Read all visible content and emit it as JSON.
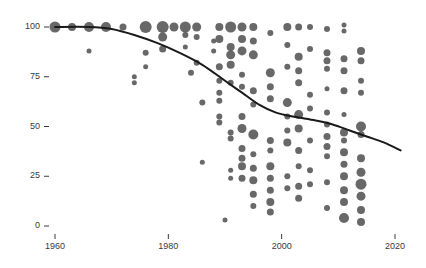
{
  "chart_data": {
    "type": "scatter",
    "title": "",
    "subtitle": "",
    "xlabel": "",
    "ylabel": "",
    "xlim": [
      1957,
      2024
    ],
    "ylim": [
      -4,
      105
    ],
    "grid": false,
    "legend": null,
    "marker_color": "#4d4d4d",
    "marker_opacity": 0.85,
    "line_color": "#1a1a1a",
    "line_width": 2.0,
    "size_encoding": "bubble area proportional to weight",
    "xticks": [
      1960,
      1980,
      2000,
      2020
    ],
    "xtick_labels": [
      "1960",
      "1980",
      "2000",
      "2020"
    ],
    "yticks": [
      0,
      25,
      50,
      75,
      100
    ],
    "ytick_labels": [
      "0",
      "25",
      "50",
      "75",
      "100"
    ],
    "series": [
      {
        "name": "observations",
        "points": [
          {
            "x": 1960,
            "y": 100,
            "size": 11
          },
          {
            "x": 1963,
            "y": 100,
            "size": 8
          },
          {
            "x": 1966,
            "y": 100,
            "size": 10
          },
          {
            "x": 1966,
            "y": 88,
            "size": 5
          },
          {
            "x": 1969,
            "y": 100,
            "size": 10
          },
          {
            "x": 1972,
            "y": 100,
            "size": 7
          },
          {
            "x": 1974,
            "y": 75,
            "size": 5
          },
          {
            "x": 1974,
            "y": 72,
            "size": 5
          },
          {
            "x": 1976,
            "y": 100,
            "size": 12
          },
          {
            "x": 1976,
            "y": 87,
            "size": 6
          },
          {
            "x": 1976,
            "y": 80,
            "size": 5
          },
          {
            "x": 1979,
            "y": 100,
            "size": 12
          },
          {
            "x": 1979,
            "y": 95,
            "size": 9
          },
          {
            "x": 1979,
            "y": 89,
            "size": 7
          },
          {
            "x": 1981,
            "y": 100,
            "size": 9
          },
          {
            "x": 1983,
            "y": 100,
            "size": 11
          },
          {
            "x": 1983,
            "y": 96,
            "size": 6
          },
          {
            "x": 1983,
            "y": 90,
            "size": 5
          },
          {
            "x": 1984,
            "y": 77,
            "size": 6
          },
          {
            "x": 1985,
            "y": 100,
            "size": 9
          },
          {
            "x": 1985,
            "y": 95,
            "size": 6
          },
          {
            "x": 1985,
            "y": 82,
            "size": 6
          },
          {
            "x": 1986,
            "y": 62,
            "size": 6
          },
          {
            "x": 1986,
            "y": 32,
            "size": 5
          },
          {
            "x": 1988,
            "y": 93,
            "size": 5
          },
          {
            "x": 1988,
            "y": 88,
            "size": 5
          },
          {
            "x": 1989,
            "y": 100,
            "size": 8
          },
          {
            "x": 1989,
            "y": 94,
            "size": 8
          },
          {
            "x": 1989,
            "y": 80,
            "size": 7
          },
          {
            "x": 1989,
            "y": 73,
            "size": 6
          },
          {
            "x": 1989,
            "y": 67,
            "size": 6
          },
          {
            "x": 1989,
            "y": 63,
            "size": 6
          },
          {
            "x": 1989,
            "y": 55,
            "size": 6
          },
          {
            "x": 1989,
            "y": 52,
            "size": 6
          },
          {
            "x": 1990,
            "y": 3,
            "size": 5
          },
          {
            "x": 1991,
            "y": 100,
            "size": 11
          },
          {
            "x": 1991,
            "y": 90,
            "size": 8
          },
          {
            "x": 1991,
            "y": 86,
            "size": 9
          },
          {
            "x": 1991,
            "y": 81,
            "size": 8
          },
          {
            "x": 1991,
            "y": 72,
            "size": 6
          },
          {
            "x": 1991,
            "y": 47,
            "size": 6
          },
          {
            "x": 1991,
            "y": 44,
            "size": 6
          },
          {
            "x": 1991,
            "y": 28,
            "size": 5
          },
          {
            "x": 1991,
            "y": 24,
            "size": 5
          },
          {
            "x": 1993,
            "y": 100,
            "size": 9
          },
          {
            "x": 1993,
            "y": 94,
            "size": 8
          },
          {
            "x": 1993,
            "y": 88,
            "size": 9
          },
          {
            "x": 1993,
            "y": 76,
            "size": 6
          },
          {
            "x": 1993,
            "y": 70,
            "size": 6
          },
          {
            "x": 1993,
            "y": 55,
            "size": 7
          },
          {
            "x": 1993,
            "y": 49,
            "size": 9
          },
          {
            "x": 1993,
            "y": 39,
            "size": 7
          },
          {
            "x": 1993,
            "y": 34,
            "size": 7
          },
          {
            "x": 1993,
            "y": 30,
            "size": 8
          },
          {
            "x": 1993,
            "y": 24,
            "size": 7
          },
          {
            "x": 1995,
            "y": 100,
            "size": 8
          },
          {
            "x": 1995,
            "y": 93,
            "size": 7
          },
          {
            "x": 1995,
            "y": 86,
            "size": 9
          },
          {
            "x": 1995,
            "y": 68,
            "size": 7
          },
          {
            "x": 1995,
            "y": 61,
            "size": 6
          },
          {
            "x": 1995,
            "y": 46,
            "size": 10
          },
          {
            "x": 1995,
            "y": 36,
            "size": 6
          },
          {
            "x": 1995,
            "y": 29,
            "size": 7
          },
          {
            "x": 1995,
            "y": 23,
            "size": 8
          },
          {
            "x": 1995,
            "y": 16,
            "size": 7
          },
          {
            "x": 1995,
            "y": 10,
            "size": 6
          },
          {
            "x": 1998,
            "y": 97,
            "size": 6
          },
          {
            "x": 1998,
            "y": 77,
            "size": 9
          },
          {
            "x": 1998,
            "y": 70,
            "size": 7
          },
          {
            "x": 1998,
            "y": 64,
            "size": 7
          },
          {
            "x": 1998,
            "y": 43,
            "size": 7
          },
          {
            "x": 1998,
            "y": 38,
            "size": 6
          },
          {
            "x": 1998,
            "y": 30,
            "size": 8
          },
          {
            "x": 1998,
            "y": 24,
            "size": 7
          },
          {
            "x": 1998,
            "y": 18,
            "size": 7
          },
          {
            "x": 1998,
            "y": 12,
            "size": 8
          },
          {
            "x": 1998,
            "y": 7,
            "size": 7
          },
          {
            "x": 2001,
            "y": 100,
            "size": 8
          },
          {
            "x": 2001,
            "y": 91,
            "size": 6
          },
          {
            "x": 2001,
            "y": 80,
            "size": 6
          },
          {
            "x": 2001,
            "y": 62,
            "size": 9
          },
          {
            "x": 2001,
            "y": 55,
            "size": 6
          },
          {
            "x": 2001,
            "y": 48,
            "size": 6
          },
          {
            "x": 2001,
            "y": 42,
            "size": 8
          },
          {
            "x": 2001,
            "y": 25,
            "size": 6
          },
          {
            "x": 2001,
            "y": 19,
            "size": 6
          },
          {
            "x": 2003,
            "y": 100,
            "size": 7
          },
          {
            "x": 2003,
            "y": 85,
            "size": 8
          },
          {
            "x": 2003,
            "y": 78,
            "size": 7
          },
          {
            "x": 2003,
            "y": 72,
            "size": 7
          },
          {
            "x": 2003,
            "y": 56,
            "size": 9
          },
          {
            "x": 2003,
            "y": 49,
            "size": 8
          },
          {
            "x": 2003,
            "y": 38,
            "size": 7
          },
          {
            "x": 2003,
            "y": 30,
            "size": 6
          },
          {
            "x": 2003,
            "y": 20,
            "size": 7
          },
          {
            "x": 2003,
            "y": 14,
            "size": 7
          },
          {
            "x": 2005,
            "y": 100,
            "size": 6
          },
          {
            "x": 2005,
            "y": 89,
            "size": 6
          },
          {
            "x": 2005,
            "y": 66,
            "size": 6
          },
          {
            "x": 2005,
            "y": 59,
            "size": 6
          },
          {
            "x": 2005,
            "y": 43,
            "size": 6
          },
          {
            "x": 2005,
            "y": 28,
            "size": 6
          },
          {
            "x": 2005,
            "y": 21,
            "size": 6
          },
          {
            "x": 2008,
            "y": 99,
            "size": 6
          },
          {
            "x": 2008,
            "y": 87,
            "size": 7
          },
          {
            "x": 2008,
            "y": 83,
            "size": 7
          },
          {
            "x": 2008,
            "y": 79,
            "size": 6
          },
          {
            "x": 2008,
            "y": 69,
            "size": 5
          },
          {
            "x": 2008,
            "y": 57,
            "size": 6
          },
          {
            "x": 2008,
            "y": 51,
            "size": 6
          },
          {
            "x": 2008,
            "y": 45,
            "size": 7
          },
          {
            "x": 2008,
            "y": 40,
            "size": 7
          },
          {
            "x": 2008,
            "y": 35,
            "size": 6
          },
          {
            "x": 2008,
            "y": 22,
            "size": 6
          },
          {
            "x": 2008,
            "y": 9,
            "size": 6
          },
          {
            "x": 2011,
            "y": 101,
            "size": 5
          },
          {
            "x": 2011,
            "y": 98,
            "size": 5
          },
          {
            "x": 2011,
            "y": 84,
            "size": 7
          },
          {
            "x": 2011,
            "y": 78,
            "size": 7
          },
          {
            "x": 2011,
            "y": 68,
            "size": 7
          },
          {
            "x": 2011,
            "y": 56,
            "size": 5
          },
          {
            "x": 2011,
            "y": 47,
            "size": 8
          },
          {
            "x": 2011,
            "y": 43,
            "size": 6
          },
          {
            "x": 2011,
            "y": 37,
            "size": 8
          },
          {
            "x": 2011,
            "y": 31,
            "size": 7
          },
          {
            "x": 2011,
            "y": 25,
            "size": 8
          },
          {
            "x": 2011,
            "y": 18,
            "size": 8
          },
          {
            "x": 2011,
            "y": 12,
            "size": 8
          },
          {
            "x": 2011,
            "y": 4,
            "size": 10
          },
          {
            "x": 2014,
            "y": 88,
            "size": 8
          },
          {
            "x": 2014,
            "y": 83,
            "size": 7
          },
          {
            "x": 2014,
            "y": 73,
            "size": 6
          },
          {
            "x": 2014,
            "y": 67,
            "size": 6
          },
          {
            "x": 2014,
            "y": 50,
            "size": 10
          },
          {
            "x": 2014,
            "y": 46,
            "size": 7
          },
          {
            "x": 2014,
            "y": 34,
            "size": 8
          },
          {
            "x": 2014,
            "y": 27,
            "size": 9
          },
          {
            "x": 2014,
            "y": 21,
            "size": 11
          },
          {
            "x": 2014,
            "y": 15,
            "size": 9
          },
          {
            "x": 2014,
            "y": 8,
            "size": 8
          },
          {
            "x": 2014,
            "y": 2,
            "size": 8
          }
        ]
      }
    ],
    "trend_line": {
      "name": "fitted trend",
      "points": [
        {
          "x": 1960,
          "y": 100
        },
        {
          "x": 1966,
          "y": 100
        },
        {
          "x": 1970,
          "y": 99
        },
        {
          "x": 1974,
          "y": 96
        },
        {
          "x": 1978,
          "y": 92
        },
        {
          "x": 1982,
          "y": 87
        },
        {
          "x": 1986,
          "y": 81
        },
        {
          "x": 1990,
          "y": 73
        },
        {
          "x": 1993,
          "y": 67
        },
        {
          "x": 1996,
          "y": 61
        },
        {
          "x": 1999,
          "y": 57
        },
        {
          "x": 2002,
          "y": 55
        },
        {
          "x": 2006,
          "y": 53
        },
        {
          "x": 2009,
          "y": 51
        },
        {
          "x": 2012,
          "y": 48
        },
        {
          "x": 2015,
          "y": 45
        },
        {
          "x": 2018,
          "y": 42
        },
        {
          "x": 2021,
          "y": 38
        }
      ]
    }
  }
}
